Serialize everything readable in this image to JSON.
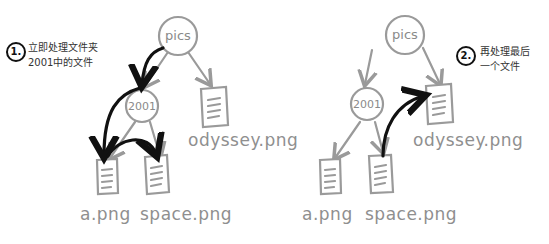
{
  "diagram": {
    "colors": {
      "tree": "#9a9a9a",
      "arrow": "#111111",
      "background": "#ffffff"
    },
    "panels": [
      {
        "step": {
          "number": "1.",
          "caption_line1": "立即处理文件夹",
          "caption_line2": "2001中的文件"
        },
        "nodes": {
          "root": "pics",
          "folder": "2001",
          "files": [
            "a.png",
            "space.png",
            "odyssey.png"
          ]
        }
      },
      {
        "step": {
          "number": "2.",
          "caption_line1": "再处理最后",
          "caption_line2": "一个文件"
        },
        "nodes": {
          "root": "pics",
          "folder": "2001",
          "files": [
            "a.png",
            "space.png",
            "odyssey.png"
          ]
        }
      }
    ]
  }
}
